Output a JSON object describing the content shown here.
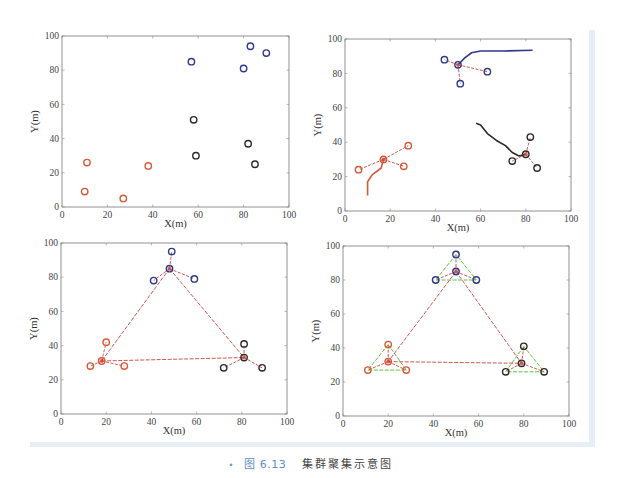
{
  "caption": {
    "bullet": "•",
    "figure_number": "图 6.13",
    "title": "集群聚集示意图"
  },
  "colors": {
    "blue": "#2e3a8c",
    "black": "#2a2a2a",
    "red": "#d9583a",
    "link_red": "#c8453a",
    "green": "#5fc43a",
    "frame_blue": "#e6eef8"
  },
  "chart_data": [
    {
      "type": "scatter",
      "title": "",
      "xlabel": "X(m)",
      "ylabel": "Y(m)",
      "xlim": [
        0,
        100
      ],
      "ylim": [
        0,
        100
      ],
      "xticks": [
        0,
        20,
        40,
        60,
        80,
        100
      ],
      "yticks": [
        0,
        20,
        40,
        60,
        80,
        100
      ],
      "grid": false,
      "series": [
        {
          "name": "blue",
          "points": [
            [
              57,
              85
            ],
            [
              80,
              81
            ],
            [
              83,
              94
            ],
            [
              90,
              90
            ]
          ]
        },
        {
          "name": "black",
          "points": [
            [
              58,
              51
            ],
            [
              59,
              30
            ],
            [
              82,
              37
            ],
            [
              85,
              25
            ]
          ]
        },
        {
          "name": "red",
          "points": [
            [
              11,
              26
            ],
            [
              10,
              9
            ],
            [
              27,
              5
            ],
            [
              38,
              24
            ]
          ]
        }
      ]
    },
    {
      "type": "scatter",
      "title": "",
      "xlabel": "X(m)",
      "ylabel": "Y(m)",
      "xlim": [
        0,
        100
      ],
      "ylim": [
        0,
        100
      ],
      "xticks": [
        0,
        20,
        40,
        60,
        80,
        100
      ],
      "yticks": [
        0,
        20,
        40,
        60,
        80,
        100
      ],
      "grid": false,
      "series": [
        {
          "name": "blue",
          "center": [
            50,
            85
          ],
          "members": [
            [
              44,
              88
            ],
            [
              63,
              81
            ],
            [
              51,
              74
            ]
          ],
          "trajectory": [
            [
              50,
              85
            ],
            [
              53,
              89
            ],
            [
              56,
              92
            ],
            [
              60,
              93
            ],
            [
              70,
              93
            ],
            [
              83,
              93.5
            ]
          ]
        },
        {
          "name": "black",
          "center": [
            80,
            33
          ],
          "members": [
            [
              74,
              29
            ],
            [
              82,
              43
            ],
            [
              85,
              25
            ]
          ],
          "trajectory": [
            [
              58,
              51
            ],
            [
              60,
              50
            ],
            [
              63,
              45
            ],
            [
              67,
              41
            ],
            [
              71,
              38
            ],
            [
              74,
              34
            ],
            [
              77,
              32
            ],
            [
              80,
              33
            ]
          ]
        },
        {
          "name": "red",
          "center": [
            17,
            30
          ],
          "members": [
            [
              6,
              24
            ],
            [
              28,
              38
            ],
            [
              26,
              26
            ]
          ],
          "trajectory": [
            [
              10,
              9
            ],
            [
              10,
              17
            ],
            [
              12,
              21
            ],
            [
              16,
              25
            ],
            [
              17,
              30
            ]
          ]
        }
      ]
    },
    {
      "type": "scatter",
      "title": "",
      "xlabel": "X(m)",
      "ylabel": "Y(m)",
      "xlim": [
        0,
        100
      ],
      "ylim": [
        0,
        100
      ],
      "xticks": [
        0,
        20,
        40,
        60,
        80,
        100
      ],
      "yticks": [
        0,
        20,
        40,
        60,
        80,
        100
      ],
      "grid": false,
      "series": [
        {
          "name": "blue",
          "center": [
            48,
            85
          ],
          "members": [
            [
              49,
              95
            ],
            [
              41,
              78
            ],
            [
              59,
              79
            ]
          ]
        },
        {
          "name": "red",
          "center": [
            18,
            31
          ],
          "members": [
            [
              20,
              42
            ],
            [
              13,
              28
            ],
            [
              28,
              28
            ]
          ]
        },
        {
          "name": "black",
          "center": [
            81,
            33
          ],
          "members": [
            [
              81,
              41
            ],
            [
              72,
              27
            ],
            [
              89,
              27
            ]
          ]
        }
      ],
      "center_links": [
        [
          [
            48,
            85
          ],
          [
            18,
            31
          ]
        ],
        [
          [
            48,
            85
          ],
          [
            81,
            33
          ]
        ],
        [
          [
            18,
            31
          ],
          [
            81,
            33
          ]
        ]
      ]
    },
    {
      "type": "scatter",
      "title": "",
      "xlabel": "X(m)",
      "ylabel": "Y(m)",
      "xlim": [
        0,
        100
      ],
      "ylim": [
        0,
        100
      ],
      "xticks": [
        0,
        20,
        40,
        60,
        80,
        100
      ],
      "yticks": [
        0,
        20,
        40,
        60,
        80,
        100
      ],
      "grid": false,
      "series": [
        {
          "name": "blue",
          "center": [
            50,
            85
          ],
          "members": [
            [
              50,
              95
            ],
            [
              41,
              80
            ],
            [
              59,
              80
            ]
          ]
        },
        {
          "name": "red",
          "center": [
            20,
            32
          ],
          "members": [
            [
              20,
              42
            ],
            [
              11,
              27
            ],
            [
              28,
              27
            ]
          ]
        },
        {
          "name": "black",
          "center": [
            79,
            31
          ],
          "members": [
            [
              80,
              41
            ],
            [
              72,
              26
            ],
            [
              89,
              26
            ]
          ]
        }
      ],
      "center_links": [
        [
          [
            50,
            85
          ],
          [
            20,
            32
          ]
        ],
        [
          [
            50,
            85
          ],
          [
            79,
            31
          ]
        ],
        [
          [
            20,
            32
          ],
          [
            79,
            31
          ]
        ]
      ],
      "formation": "green triangle connecting each cluster's three members"
    }
  ]
}
